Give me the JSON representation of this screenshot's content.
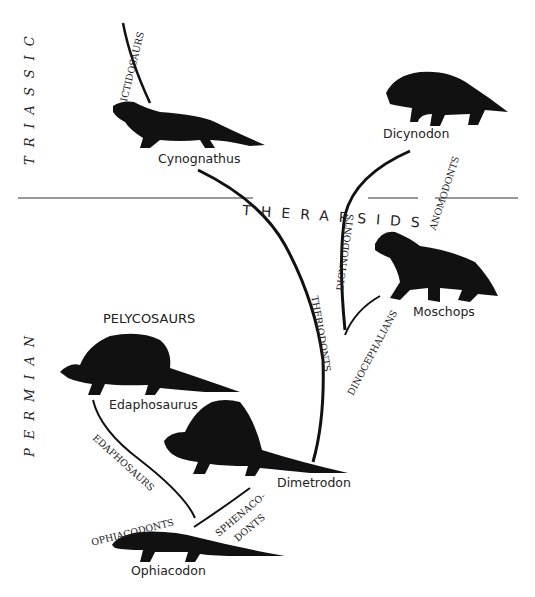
{
  "periods": {
    "upper": "TRIASSIC",
    "lower": "PERMIAN"
  },
  "groups": {
    "therapsids": "THERAPSIDS",
    "pelycosaurs": "PELYCOSAURS"
  },
  "clades": {
    "ictidosaurs": "ICTIDOSAURS",
    "theriodonts": "THERIODONTS",
    "dicynodonts": "DICYNODONTS",
    "anomodonts": "ANOMODONTS",
    "dinocephalians": "DINOCEPHALIANS",
    "edaphosaurs": "EDAPHOSAURS",
    "ophiacodonts": "OPHIACODONTS",
    "sphenacodonts_line1": "SPHENACO-",
    "sphenacodonts_line2": "DONTS"
  },
  "animals": {
    "cynognathus": "Cynognathus",
    "dicynodon": "Dicynodon",
    "moschops": "Moschops",
    "edaphosaurus": "Edaphosaurus",
    "dimetrodon": "Dimetrodon",
    "ophiacodon": "Ophiacodon"
  },
  "colors": {
    "ink": "#111111",
    "background": "#ffffff"
  }
}
